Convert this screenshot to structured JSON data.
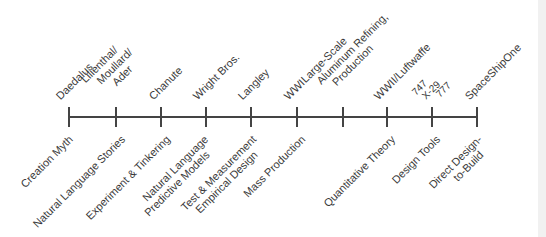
{
  "timeline": {
    "ticks_x": [
      69,
      116,
      161,
      206,
      251,
      297,
      343,
      387,
      432,
      477
    ],
    "top_labels": [
      {
        "text": "Daedalus"
      },
      {
        "lines": [
          "Lilienthal/",
          "Moullard/",
          "Ader"
        ]
      },
      {
        "text": "Chanute"
      },
      {
        "text": "Wright Bros."
      },
      {
        "text": "Langley"
      },
      {
        "text": "WWI"
      },
      {
        "lines": [
          "Large-Scale",
          "Aluminum Refining,",
          "Production"
        ]
      },
      {
        "text": "WWII/Luftwaffe"
      },
      {
        "aircraft": [
          "747",
          "X-29",
          "777"
        ]
      },
      {
        "text": "SpaceShipOne"
      }
    ],
    "bottom_labels": [
      {
        "text": "Creation Myth"
      },
      {
        "text": "Natural Language Stories"
      },
      {
        "text": "Experiment & Tinkering"
      },
      {
        "lines": [
          "Natural Language",
          "Predictive Models"
        ]
      },
      {
        "lines": [
          "Test & Measurement",
          "Empirical Design"
        ]
      },
      {
        "text": "Mass Production"
      },
      {
        "text": "Quantitative Theory"
      },
      {
        "text": "Design Tools"
      },
      {
        "lines": [
          "Direct Design-",
          "to-Build"
        ]
      }
    ]
  }
}
